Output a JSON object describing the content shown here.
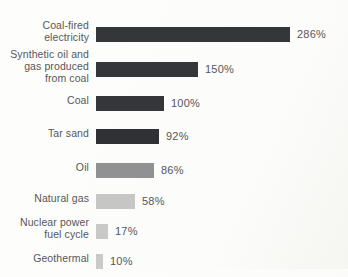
{
  "chart_data": {
    "type": "bar",
    "orientation": "horizontal",
    "title": "",
    "xlabel": "",
    "ylabel": "",
    "unit": "%",
    "xlim": [
      0,
      300
    ],
    "grid": false,
    "legend": false,
    "categories": [
      "Coal-fired electricity",
      "Synthetic oil and gas produced from coal",
      "Coal",
      "Tar sand",
      "Oil",
      "Natural gas",
      "Nuclear power fuel cycle",
      "Geothermal"
    ],
    "values": [
      286,
      150,
      100,
      92,
      86,
      58,
      17,
      10
    ],
    "rows": [
      {
        "label": "Coal-fired electricity",
        "value": 286,
        "value_label": "286%",
        "color": "#343639"
      },
      {
        "label": "Synthetic oil and gas produced from coal",
        "value": 150,
        "value_label": "150%",
        "color": "#343639"
      },
      {
        "label": "Coal",
        "value": 100,
        "value_label": "100%",
        "color": "#343639"
      },
      {
        "label": "Tar sand",
        "value": 92,
        "value_label": "92%",
        "color": "#2f3134"
      },
      {
        "label": "Oil",
        "value": 86,
        "value_label": "86%",
        "color": "#909193"
      },
      {
        "label": "Natural gas",
        "value": 58,
        "value_label": "58%",
        "color": "#c6c7c5"
      },
      {
        "label": "Nuclear power fuel cycle",
        "value": 17,
        "value_label": "17%",
        "color": "#c9cac8"
      },
      {
        "label": "Geothermal",
        "value": 10,
        "value_label": "10%",
        "color": "#cacbc9"
      }
    ]
  },
  "colors": {
    "background": "#fcfcfa",
    "text": "#56575a",
    "dark_bar": "#343639",
    "medium_bar": "#909193",
    "light_bar": "#c9cac8"
  }
}
